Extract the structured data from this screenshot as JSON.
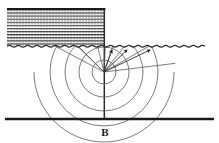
{
  "figure": {
    "caption_label": "B",
    "caption_x": 105,
    "caption_y": 136,
    "width": 219,
    "height": 143,
    "background_color": "#ffffff",
    "line_color": "#3a3a3a",
    "heavy_line_color": "#1a1a1a",
    "hatch_color": "#4d4d4d"
  },
  "layers": {
    "hatched_block": {
      "name": "hatched-layer",
      "x": 7,
      "y": 8,
      "width": 98,
      "height": 38,
      "fill_pattern": "horizontal-dotted-hatch",
      "top_edge_color": "#1a1a1a"
    },
    "free_surface": {
      "name": "wavy-free-surface",
      "y": 46,
      "x_start": 7,
      "x_end": 214,
      "wave_amplitude": 1.6,
      "wave_period": 9
    },
    "basement_boundary": {
      "name": "basement-interface",
      "y": 119,
      "x_start": 5,
      "x_end": 214,
      "thickness": 2.4
    },
    "vertical_axis": {
      "name": "source-vertical-axis",
      "x": 104,
      "y_start": 8,
      "y_end": 119
    }
  },
  "source": {
    "name": "point-source",
    "x": 104,
    "y": 72
  },
  "wavefronts": {
    "label": "concentric-wavefront-arcs",
    "center_x": 104,
    "center_y": 72,
    "radii": [
      12,
      25,
      39,
      54,
      70
    ],
    "angle_start_deg": 200,
    "angle_end_deg": 340
  },
  "rays": {
    "label": "radial-ray-paths",
    "center_x": 104,
    "center_y": 72,
    "angles_deg": [
      208,
      224,
      240,
      256,
      272,
      288,
      304,
      320,
      336
    ],
    "inner_radius": 0,
    "outer_radius": 78
  },
  "arrows": [
    {
      "name": "upgoing-ray-arrow-1",
      "tail_x": 107,
      "tail_y": 58,
      "head_x": 112,
      "head_y": 47
    },
    {
      "name": "upgoing-ray-arrow-2",
      "tail_x": 119,
      "tail_y": 60,
      "head_x": 127,
      "head_y": 47
    },
    {
      "name": "upgoing-ray-arrow-3",
      "tail_x": 139,
      "tail_y": 63,
      "head_x": 150,
      "head_y": 47
    }
  ],
  "upgoing_ray_lines": [
    {
      "name": "upgoing-ray-line-1",
      "x1": 104,
      "y1": 72,
      "x2": 112,
      "y2": 47
    },
    {
      "name": "upgoing-ray-line-2",
      "x1": 104,
      "y1": 72,
      "x2": 127,
      "y2": 47
    },
    {
      "name": "upgoing-ray-line-3",
      "x1": 104,
      "y1": 72,
      "x2": 150,
      "y2": 47
    }
  ]
}
